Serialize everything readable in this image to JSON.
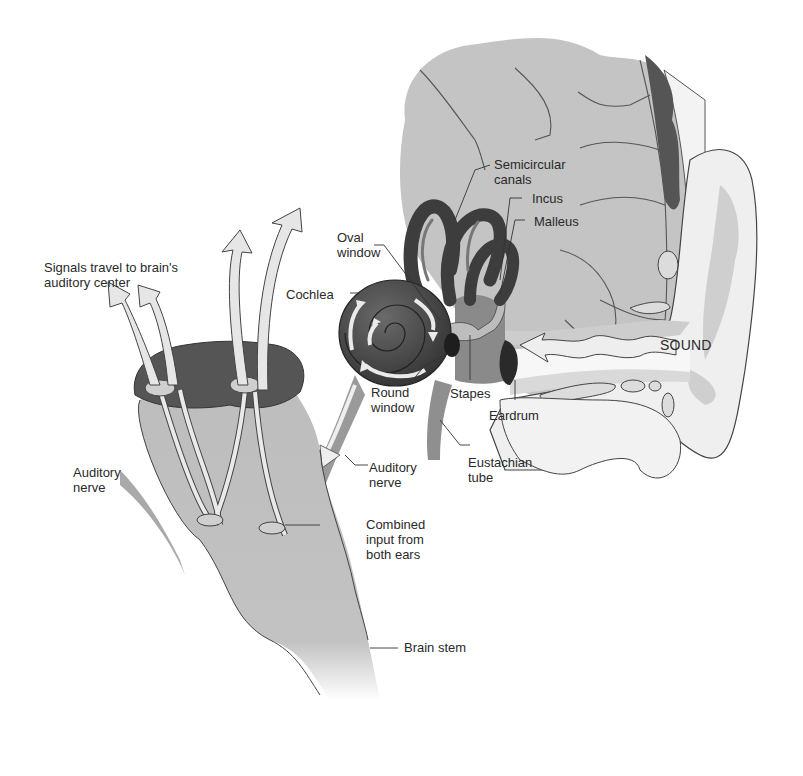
{
  "figure": {
    "colors": {
      "background": "#ffffff",
      "brain_tissue": "#c4c4c4",
      "brain_stem": "#bdbdbd",
      "dark_tissue": "#4a4a4a",
      "inner_ear": "#3d3d3d",
      "pathway_arrow": "#e6e6e6",
      "outline": "#333333",
      "outer_ear": "#efefef",
      "outer_ear_shade": "#c9c9c9"
    }
  },
  "labels": {
    "signals": "Signals travel to brain's\nauditory center",
    "semicircular_canals": "Semicircular\ncanals",
    "incus": "Incus",
    "malleus": "Malleus",
    "oval_window": "Oval\nwindow",
    "cochlea": "Cochlea",
    "sound": "SOUND",
    "stapes": "Stapes",
    "eardrum": "Eardrum",
    "round_window": "Round\nwindow",
    "eustachian_tube": "Eustachian\ntube",
    "auditory_nerve_right": "Auditory\nnerve",
    "auditory_nerve_left": "Auditory\nnerve",
    "combined_input": "Combined\ninput from\nboth ears",
    "brain_stem": "Brain stem"
  }
}
